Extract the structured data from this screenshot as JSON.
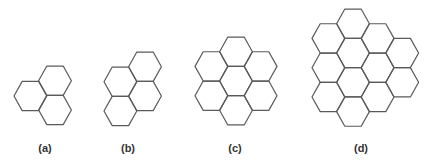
{
  "figure": {
    "stroke_color": "#5a5a5a",
    "hex_half_width": 16.4,
    "hex_half_height": 14.65,
    "panels": [
      {
        "label": "(a)",
        "label_x": 45,
        "hex_count": 3,
        "centers": [
          [
            30.4,
            96.0
          ],
          [
            55.0,
            80.7
          ],
          [
            55.0,
            110.0
          ]
        ]
      },
      {
        "label": "(b)",
        "label_x": 128,
        "hex_count": 4,
        "centers": [
          [
            120.4,
            81.7
          ],
          [
            120.4,
            111.0
          ],
          [
            145.0,
            66.7
          ],
          [
            145.0,
            96.0
          ]
        ]
      },
      {
        "label": "(c)",
        "label_x": 235,
        "hex_count": 7,
        "centers": [
          [
            211.4,
            66.4
          ],
          [
            211.4,
            95.7
          ],
          [
            236.0,
            51.7
          ],
          [
            236.0,
            81.0
          ],
          [
            236.0,
            110.3
          ],
          [
            260.6,
            66.4
          ],
          [
            260.6,
            95.7
          ]
        ]
      },
      {
        "label": "(d)",
        "label_x": 361,
        "hex_count": 12,
        "centers": [
          [
            328.4,
            38.4
          ],
          [
            328.4,
            67.7
          ],
          [
            328.4,
            97.0
          ],
          [
            353.0,
            23.7
          ],
          [
            353.0,
            53.0
          ],
          [
            353.0,
            82.3
          ],
          [
            353.0,
            111.6
          ],
          [
            377.6,
            38.4
          ],
          [
            377.6,
            67.7
          ],
          [
            377.6,
            97.0
          ],
          [
            402.2,
            53.0
          ],
          [
            402.2,
            82.3
          ]
        ]
      }
    ]
  }
}
